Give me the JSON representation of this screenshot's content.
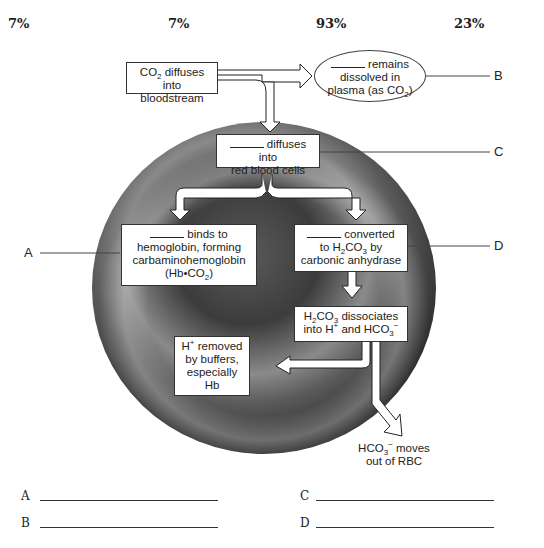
{
  "percentages": [
    "7%",
    "7%",
    "93%",
    "23%"
  ],
  "boxes": {
    "co2_bloodstream": {
      "line1_a": "CO",
      "line1_sub": "2",
      "line1_b": " diffuses",
      "line2": "into bloodstream"
    },
    "plasma": {
      "line1": "remains",
      "line2": "dissolved in",
      "line3_a": "plasma (as CO",
      "line3_sub": "2",
      "line3_b": ")"
    },
    "rbc": {
      "line1": "diffuses into",
      "line2": "red blood cells"
    },
    "hemoglobin": {
      "line1": "binds to",
      "line2": "hemoglobin, forming",
      "line3": "carbaminohemoglobin",
      "line4_a": "(Hb•CO",
      "line4_sub": "2",
      "line4_b": ")"
    },
    "converted": {
      "line1": "converted",
      "line2_a": "to H",
      "line2_sub1": "2",
      "line2_b": "CO",
      "line2_sub2": "3",
      "line2_c": " by",
      "line3": "carbonic anhydrase"
    },
    "dissociates": {
      "line1_a": "H",
      "line1_sub1": "2",
      "line1_b": "CO",
      "line1_sub2": "3",
      "line1_c": " dissociates",
      "line2_a": "into H",
      "line2_sup": "+",
      "line2_b": " and HCO",
      "line2_sub": "3",
      "line2_sup2": "−"
    },
    "h_removed": {
      "line1_a": "H",
      "line1_sup": "+",
      "line1_b": " removed",
      "line2": "by buffers,",
      "line3": "especially",
      "line4": "Hb"
    },
    "hco3_moves": {
      "line1_a": "HCO",
      "line1_sub": "3",
      "line1_sup": "−",
      "line1_b": " moves",
      "line2": "out of RBC"
    }
  },
  "labels": {
    "A": "A",
    "B": "B",
    "C": "C",
    "D": "D"
  },
  "answers": [
    {
      "letter": "A",
      "value": ""
    },
    {
      "letter": "B",
      "value": ""
    },
    {
      "letter": "C",
      "value": ""
    },
    {
      "letter": "D",
      "value": ""
    }
  ]
}
